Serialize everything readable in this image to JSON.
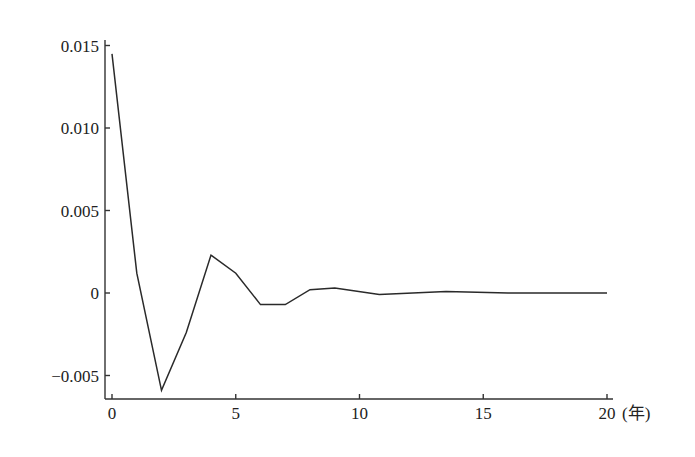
{
  "chart_data": {
    "type": "line",
    "title": "",
    "xlabel": "(年)",
    "ylabel": "",
    "xlim": [
      0,
      20
    ],
    "ylim": [
      -0.0063,
      0.0153
    ],
    "grid": false,
    "legend": null,
    "x_ticks": [
      0,
      5,
      10,
      15,
      20
    ],
    "x_tick_labels": [
      "0",
      "5",
      "10",
      "15",
      "20"
    ],
    "y_ticks": [
      -0.005,
      0,
      0.005,
      0.01,
      0.015
    ],
    "y_tick_labels": [
      "-0.005",
      "0",
      "0.005",
      "0.010",
      "0.015"
    ],
    "series": [
      {
        "name": "response",
        "x": [
          0,
          1,
          2,
          3,
          4,
          5,
          6,
          7,
          8,
          9,
          10.8,
          13.5,
          16,
          20
        ],
        "values": [
          0.0145,
          0.0012,
          -0.0059,
          -0.0024,
          0.0023,
          0.0012,
          -0.0007,
          -0.0007,
          0.0002,
          0.0003,
          -0.0001,
          0.0001,
          0.0,
          0.0
        ]
      }
    ]
  }
}
